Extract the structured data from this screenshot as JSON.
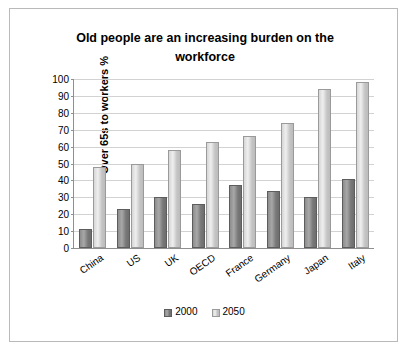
{
  "chart_data": {
    "type": "bar",
    "title": "Old people are an increasing burden on the workforce",
    "xlabel": "",
    "ylabel": "Over 65s to workers %",
    "categories": [
      "China",
      "US",
      "UK",
      "OECD",
      "France",
      "Germany",
      "Japan",
      "Italy"
    ],
    "series": [
      {
        "name": "2000",
        "values": [
          11,
          23,
          30,
          26,
          37,
          34,
          30,
          41
        ]
      },
      {
        "name": "2050",
        "values": [
          48,
          50,
          58,
          63,
          66,
          74,
          94,
          98
        ]
      }
    ],
    "ylim": [
      0,
      100
    ],
    "yticks": [
      0,
      10,
      20,
      30,
      40,
      50,
      60,
      70,
      80,
      90,
      100
    ],
    "grid": true,
    "legend_position": "bottom",
    "colors": {
      "series_2000": "#8d8d8d",
      "series_2050": "#d6d6d6",
      "grid": "#d2d2d2",
      "axis": "#8f8f8f",
      "border": "#b9b9b9"
    }
  }
}
